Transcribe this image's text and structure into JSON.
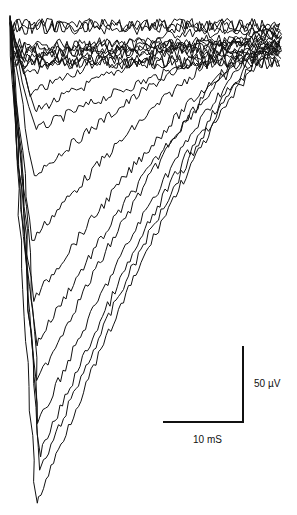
{
  "chart_data": {
    "type": "line",
    "title": "",
    "xlabel": "",
    "ylabel": "",
    "grid": false,
    "legend": null,
    "scale_bars": {
      "vertical": {
        "label": "50 µV",
        "value": 50,
        "unit": "µV",
        "x": 243,
        "y1": 346,
        "y2": 422
      },
      "horizontal": {
        "label": "10 mS",
        "value": 10,
        "unit": "mS",
        "x1": 163,
        "x2": 243,
        "y": 422
      }
    },
    "trace_color": "#111111",
    "baseline_y": 45,
    "start": {
      "x": 10,
      "y": 15
    },
    "end_x": 280,
    "series": [
      {
        "name": "trace-1",
        "min_x": 22,
        "min_y": 60,
        "recover_x": 120
      },
      {
        "name": "trace-2",
        "min_x": 25,
        "min_y": 75,
        "recover_x": 150
      },
      {
        "name": "trace-3",
        "min_x": 30,
        "min_y": 95,
        "recover_x": 180
      },
      {
        "name": "trace-4",
        "min_x": 34,
        "min_y": 112,
        "recover_x": 210
      },
      {
        "name": "trace-5",
        "min_x": 36,
        "min_y": 130,
        "recover_x": 230
      },
      {
        "name": "trace-6",
        "min_x": 34,
        "min_y": 175,
        "recover_x": 250
      },
      {
        "name": "trace-7",
        "min_x": 32,
        "min_y": 240,
        "recover_x": 255
      },
      {
        "name": "trace-8",
        "min_x": 34,
        "min_y": 300,
        "recover_x": 260
      },
      {
        "name": "trace-9",
        "min_x": 36,
        "min_y": 345,
        "recover_x": 262
      },
      {
        "name": "trace-10",
        "min_x": 38,
        "min_y": 380,
        "recover_x": 265
      },
      {
        "name": "trace-11",
        "min_x": 38,
        "min_y": 425,
        "recover_x": 268
      },
      {
        "name": "trace-12",
        "min_x": 40,
        "min_y": 455,
        "recover_x": 270
      },
      {
        "name": "trace-13",
        "min_x": 41,
        "min_y": 470,
        "recover_x": 272
      },
      {
        "name": "trace-14",
        "min_x": 36,
        "min_y": 505,
        "recover_x": 275
      }
    ]
  }
}
